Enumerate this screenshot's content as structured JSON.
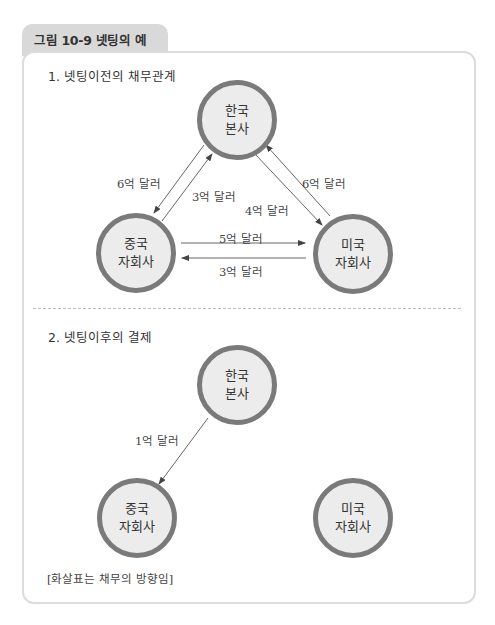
{
  "figure": {
    "tab_label": "그림 10-9  넷팅의 예"
  },
  "section1": {
    "title": "1. 넷팅이전의 채무관계",
    "nodes": {
      "korea": {
        "line1": "한국",
        "line2": "본사"
      },
      "china": {
        "line1": "중국",
        "line2": "자회사"
      },
      "usa": {
        "line1": "미국",
        "line2": "자회사"
      }
    },
    "flows": [
      {
        "from": "korea",
        "to": "china",
        "label": "6억 달러"
      },
      {
        "from": "china",
        "to": "korea",
        "label": "3억 달러"
      },
      {
        "from": "korea",
        "to": "usa",
        "label": "4억 달러"
      },
      {
        "from": "usa",
        "to": "korea",
        "label": "6억 달러"
      },
      {
        "from": "china",
        "to": "usa",
        "label": "5억 달러"
      },
      {
        "from": "usa",
        "to": "china",
        "label": "3억 달러"
      }
    ]
  },
  "section2": {
    "title": "2. 넷팅이후의 결제",
    "nodes": {
      "korea": {
        "line1": "한국",
        "line2": "본사"
      },
      "china": {
        "line1": "중국",
        "line2": "자회사"
      },
      "usa": {
        "line1": "미국",
        "line2": "자회사"
      }
    },
    "flows": [
      {
        "from": "korea",
        "to": "china",
        "label": "1억 달러"
      }
    ]
  },
  "note": "[화살표는 채무의 방향임]",
  "colors": {
    "node_fill": "#ececec",
    "node_border": "#7a7a7a",
    "tab_bg": "#d9d9d9",
    "arrow": "#555555"
  }
}
